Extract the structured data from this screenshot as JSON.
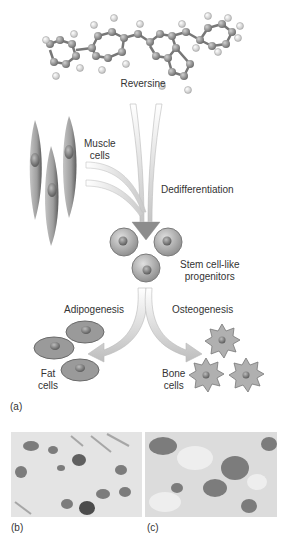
{
  "figure": {
    "panel_a": {
      "label": "(a)",
      "molecule_label": "Reversine",
      "muscle_label_line1": "Muscle",
      "muscle_label_line2": "cells",
      "process_dedifferentiation": "Dedifferentiation",
      "stem_label_line1": "Stem cell-like",
      "stem_label_line2": "progenitors",
      "process_adipogenesis": "Adipogenesis",
      "process_osteogenesis": "Osteogenesis",
      "fat_label_line1": "Fat",
      "fat_label_line2": "cells",
      "bone_label_line1": "Bone",
      "bone_label_line2": "cells"
    },
    "panel_b": {
      "label": "(b)"
    },
    "panel_c": {
      "label": "(c)"
    },
    "colors": {
      "cell_fill": "#a8a8a8",
      "cell_dark": "#6e6e6e",
      "arrow_fill": "#d8d8d8",
      "text": "#333333"
    }
  }
}
